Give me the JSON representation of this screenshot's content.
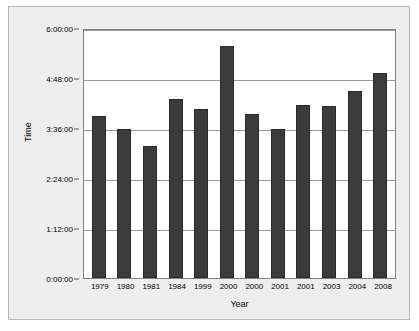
{
  "chart_data": {
    "type": "bar",
    "title": "",
    "xlabel": "Year",
    "ylabel": "Time",
    "categories": [
      "1979",
      "1980",
      "1981",
      "1984",
      "1999",
      "2000",
      "2000",
      "2001",
      "2001",
      "2003",
      "2004",
      "2008"
    ],
    "values": [
      "3:54:00",
      "3:35:00",
      "3:10:00",
      "4:18:00",
      "4:03:00",
      "5:34:00",
      "3:56:00",
      "3:35:00",
      "4:09:00",
      "4:08:00",
      "4:30:00",
      "4:55:00"
    ],
    "values_hours": [
      3.9,
      3.58,
      3.17,
      4.3,
      4.05,
      5.57,
      3.93,
      3.58,
      4.15,
      4.13,
      4.5,
      4.92
    ],
    "ytick_labels": [
      "6:00:00",
      "4:48:00",
      "3:36:00",
      "2:24:00",
      "1:12:00",
      "0:00:00"
    ],
    "ytick_hours": [
      6,
      4.8,
      3.6,
      2.4,
      1.2,
      0
    ],
    "ylim": [
      0,
      6
    ],
    "grid": true,
    "legend": "none",
    "bar_color": "#3b3b3b",
    "plot_background": "#ffffff",
    "figure_background": "#eeeeee",
    "gridline_color": "#9a9a9a",
    "axis_color": "#808080"
  }
}
